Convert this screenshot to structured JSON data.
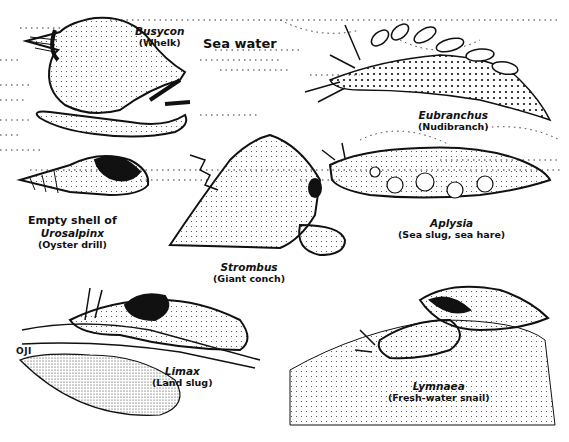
{
  "plate": {
    "background_label": "Sea water",
    "signature": "OJI",
    "specimens": [
      {
        "id": "busycon",
        "genus": "Busycon",
        "common": "(Whelk)"
      },
      {
        "id": "eubranchus",
        "genus": "Eubranchus",
        "common": "(Nudibranch)"
      },
      {
        "id": "urosalpinx",
        "prefix": "Empty shell of",
        "genus": "Urosalpinx",
        "common": "(Oyster drill)"
      },
      {
        "id": "strombus",
        "genus": "Strombus",
        "common": "(Giant conch)"
      },
      {
        "id": "aplysia",
        "genus": "Aplysia",
        "common": "(Sea slug, sea hare)"
      },
      {
        "id": "limax",
        "genus": "Limax",
        "common": "(Land slug)"
      },
      {
        "id": "lymnaea",
        "genus": "Lymnaea",
        "common": "(Fresh-water snail)"
      }
    ]
  },
  "colors": {
    "ink": "#111111",
    "paper": "#ffffff",
    "stipple": "#555555"
  }
}
